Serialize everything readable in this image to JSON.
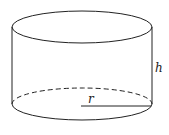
{
  "diagram": {
    "type": "cylinder",
    "labels": {
      "radius": "r",
      "height": "h"
    },
    "colors": {
      "stroke": "#222222",
      "background": "#ffffff"
    }
  }
}
